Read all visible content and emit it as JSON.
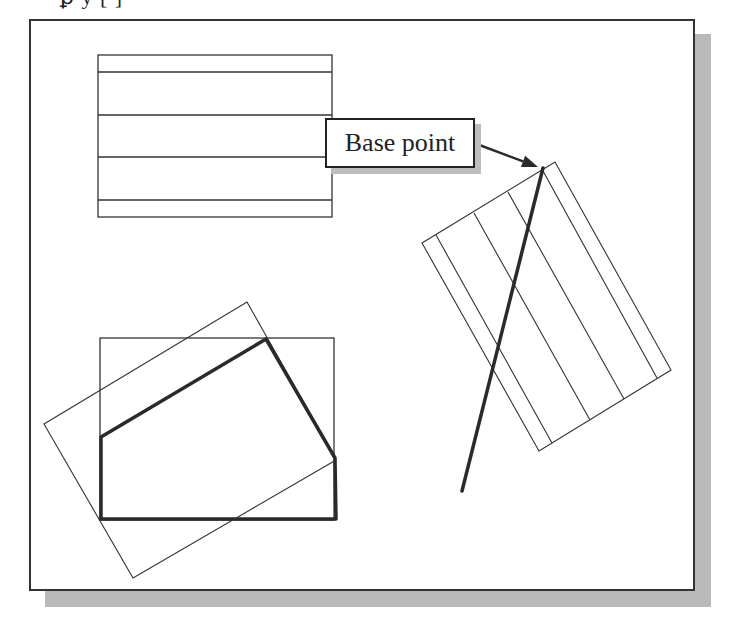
{
  "top_text_fragment": "ꝑ  y                    [          ]",
  "callout": {
    "label": "Base point",
    "arrow_from": [
      474,
      143
    ],
    "arrow_to": [
      538,
      167
    ]
  },
  "colors": {
    "stroke": "#333333",
    "thick_stroke": "#2a2a2a",
    "shadow": "#b9b9b9",
    "background": "#ffffff"
  },
  "shapes": {
    "top_rectangle": {
      "x": 98,
      "y": 55,
      "width": 234,
      "height": 162,
      "inner_lines_y": [
        72,
        115,
        157,
        200
      ]
    },
    "rotated_hatched_rectangle": {
      "corners": [
        [
          555,
          162
        ],
        [
          671,
          370
        ],
        [
          539,
          451
        ],
        [
          422,
          243
        ]
      ],
      "inner_lines": [
        [
          [
            436,
            235
          ],
          [
            552,
            443
          ]
        ],
        [
          [
            474,
            213
          ],
          [
            590,
            420
          ]
        ],
        [
          [
            508,
            192
          ],
          [
            624,
            399
          ]
        ],
        [
          [
            543,
            171
          ],
          [
            657,
            378
          ]
        ]
      ]
    },
    "thick_line": {
      "from": [
        543,
        168
      ],
      "to": [
        462,
        491
      ]
    },
    "bottom_rectangle": {
      "x": 100,
      "y": 338,
      "width": 234,
      "height": 182
    },
    "bottom_rotated_rectangle": {
      "corners": [
        [
          247,
          302
        ],
        [
          336,
          460
        ],
        [
          133,
          578
        ],
        [
          44,
          424
        ]
      ]
    },
    "thick_polygon": {
      "points": [
        [
          101,
          437
        ],
        [
          266,
          339
        ],
        [
          335,
          458
        ],
        [
          336,
          519
        ],
        [
          101,
          519
        ]
      ]
    }
  }
}
